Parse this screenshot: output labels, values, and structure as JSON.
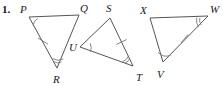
{
  "problem": {
    "number": "1."
  },
  "figure": {
    "type": "geometry-triangles",
    "stroke_color": "#555555",
    "label_color": "#1a1a1a",
    "background": "#ffffff",
    "triangles": [
      {
        "name": "triangle-pqr",
        "vertices": [
          {
            "label": "P",
            "x": 29,
            "y": 17,
            "label_x": 20,
            "label_y": 13
          },
          {
            "label": "Q",
            "x": 79,
            "y": 15,
            "label_x": 80,
            "label_y": 12
          },
          {
            "label": "R",
            "x": 57,
            "y": 68,
            "label_x": 53,
            "label_y": 83
          }
        ],
        "angle_marks": [
          {
            "at": "P",
            "count": 1
          },
          {
            "at": "R",
            "count": 2
          }
        ],
        "side_ticks": [
          {
            "side": "PR",
            "count": 1
          }
        ]
      },
      {
        "name": "triangle-stu",
        "vertices": [
          {
            "label": "S",
            "x": 110,
            "y": 18,
            "label_x": 107,
            "label_y": 12
          },
          {
            "label": "U",
            "x": 80,
            "y": 47,
            "label_x": 70,
            "label_y": 50
          },
          {
            "label": "T",
            "x": 133,
            "y": 66,
            "label_x": 136,
            "label_y": 81
          }
        ],
        "angle_marks": [
          {
            "at": "U",
            "count": 1
          },
          {
            "at": "T",
            "count": 2
          }
        ],
        "side_ticks": [
          {
            "side": "ST",
            "count": 1
          }
        ]
      },
      {
        "name": "triangle-xvw",
        "vertices": [
          {
            "label": "X",
            "x": 150,
            "y": 18,
            "label_x": 140,
            "label_y": 14
          },
          {
            "label": "W",
            "x": 208,
            "y": 16,
            "label_x": 210,
            "label_y": 13
          },
          {
            "label": "V",
            "x": 163,
            "y": 62,
            "label_x": 158,
            "label_y": 78
          }
        ],
        "angle_marks": [
          {
            "at": "W",
            "count": 2
          },
          {
            "at": "V",
            "count": 1
          }
        ],
        "side_ticks": [
          {
            "side": "VW",
            "count": 1
          }
        ]
      }
    ]
  }
}
